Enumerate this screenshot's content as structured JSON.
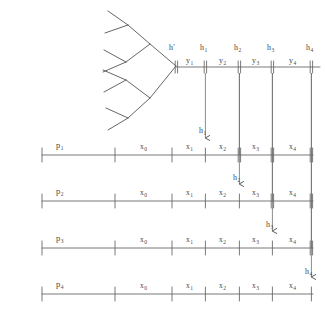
{
  "diagram": {
    "style": {
      "ink": "#4a4a4a",
      "background": "#ffffff"
    },
    "tree": {
      "name": "binary-history-tree",
      "root_label": "h'",
      "depth": 3,
      "orientation": "opens-leftward"
    },
    "top_timeline": {
      "name": "global-history-axis",
      "root_label": "h'",
      "intervals": [
        {
          "label": "y",
          "sub": "1"
        },
        {
          "label": "y",
          "sub": "2"
        },
        {
          "label": "y",
          "sub": "3"
        },
        {
          "label": "y",
          "sub": "4"
        }
      ],
      "marks": [
        {
          "label": "h",
          "sub": "1"
        },
        {
          "label": "h",
          "sub": "2"
        },
        {
          "label": "h",
          "sub": "3"
        },
        {
          "label": "h",
          "sub": "4"
        }
      ]
    },
    "processes": [
      {
        "name": "process-line-1",
        "label": "p",
        "sub": "1",
        "segments": [
          {
            "label": "x",
            "sub": "0"
          },
          {
            "label": "x",
            "sub": "1"
          },
          {
            "label": "x",
            "sub": "2"
          },
          {
            "label": "x",
            "sub": "3"
          },
          {
            "label": "x",
            "sub": "4"
          }
        ],
        "arrival": {
          "label": "h",
          "sub": "1"
        }
      },
      {
        "name": "process-line-2",
        "label": "p",
        "sub": "2",
        "segments": [
          {
            "label": "x",
            "sub": "0"
          },
          {
            "label": "x",
            "sub": "1"
          },
          {
            "label": "x",
            "sub": "2"
          },
          {
            "label": "x",
            "sub": "3"
          },
          {
            "label": "x",
            "sub": "4"
          }
        ],
        "arrival": {
          "label": "h",
          "sub": "2"
        }
      },
      {
        "name": "process-line-3",
        "label": "p",
        "sub": "3",
        "segments": [
          {
            "label": "x",
            "sub": "0"
          },
          {
            "label": "x",
            "sub": "1"
          },
          {
            "label": "x",
            "sub": "2"
          },
          {
            "label": "x",
            "sub": "3"
          },
          {
            "label": "x",
            "sub": "4"
          }
        ],
        "arrival": {
          "label": "h",
          "sub": "3"
        }
      },
      {
        "name": "process-line-4",
        "label": "p",
        "sub": "4",
        "segments": [
          {
            "label": "x",
            "sub": "0"
          },
          {
            "label": "x",
            "sub": "1"
          },
          {
            "label": "x",
            "sub": "2"
          },
          {
            "label": "x",
            "sub": "3"
          },
          {
            "label": "x",
            "sub": "4"
          }
        ],
        "arrival": {
          "label": "h",
          "sub": "4"
        }
      }
    ],
    "labels": {
      "h_prime": "h'",
      "y1": "y",
      "y1s": "1",
      "y2": "y",
      "y2s": "2",
      "y3": "y",
      "y3s": "3",
      "y4": "y",
      "y4s": "4",
      "h1": "h",
      "h1s": "1",
      "h2": "h",
      "h2s": "2",
      "h3": "h",
      "h3s": "3",
      "h4": "h",
      "h4s": "4",
      "p1": "p",
      "p1s": "1",
      "p2": "p",
      "p2s": "2",
      "p3": "p",
      "p3s": "3",
      "p4": "p",
      "p4s": "4",
      "x0": "x",
      "x0s": "0",
      "x1": "x",
      "x1s": "1",
      "x2": "x",
      "x2s": "2",
      "x3": "x",
      "x3s": "3",
      "x4": "x",
      "x4s": "4",
      "arr_h1": "h",
      "arr_h1s": "1",
      "arr_h2": "h",
      "arr_h2s": "2",
      "arr_h3": "h",
      "arr_h3s": "3",
      "arr_h4": "h",
      "arr_h4s": "4"
    }
  }
}
